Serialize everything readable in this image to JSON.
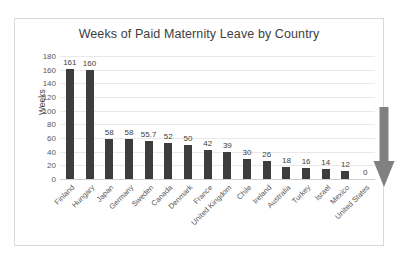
{
  "chart_data": {
    "type": "bar",
    "title": "Weeks of Paid Maternity Leave by Country",
    "xlabel": "",
    "ylabel": "Weeks",
    "ylim": [
      0,
      180
    ],
    "ytick_step": 20,
    "yticks": [
      "180",
      "160",
      "140",
      "120",
      "100",
      "80",
      "60",
      "40",
      "20",
      "0"
    ],
    "grid": true,
    "legend": "none",
    "categories": [
      "Finland",
      "Hungary",
      "Japan",
      "Germany",
      "Sweden",
      "Canada",
      "Denmark",
      "France",
      "United Kingdom",
      "Chile",
      "Ireland",
      "Australia",
      "Turkey",
      "Israel",
      "Mexico",
      "United States"
    ],
    "values": [
      161,
      160,
      58,
      58,
      55.7,
      52,
      50,
      42,
      39,
      30,
      26,
      18,
      16,
      14,
      12,
      0
    ],
    "value_labels": [
      "161",
      "160",
      "58",
      "58",
      "55.7",
      "52",
      "50",
      "42",
      "39",
      "30",
      "26",
      "18",
      "16",
      "14",
      "12",
      "0"
    ],
    "bar_color": "#3d3d3d",
    "gridline_color": "#e8e8e8",
    "plot_background": "#ffffff",
    "annotations": [
      {
        "name": "down-arrow",
        "points_to": "United States",
        "color": "#808080",
        "direction": "down"
      }
    ]
  }
}
